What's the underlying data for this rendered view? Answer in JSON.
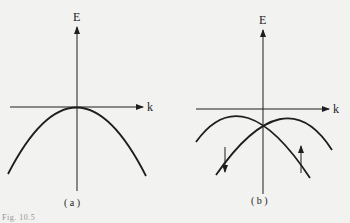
{
  "figure": {
    "panels": [
      {
        "id": "a",
        "label": "( a )",
        "y_axis_label": "E",
        "x_axis_label": "k",
        "description": "single parabolic band, maximum at k = 0"
      },
      {
        "id": "b",
        "label": "( b )",
        "y_axis_label": "E",
        "x_axis_label": "k",
        "description": "two spin-split parabolic bands, maxima shifted to ±k0, crossing at k = 0",
        "spin_arrows": [
          "down",
          "up"
        ]
      }
    ],
    "caption": "Fig. 10.5"
  },
  "colors": {
    "ink": "#1e1e1e",
    "paper": "#f2f2f0"
  }
}
